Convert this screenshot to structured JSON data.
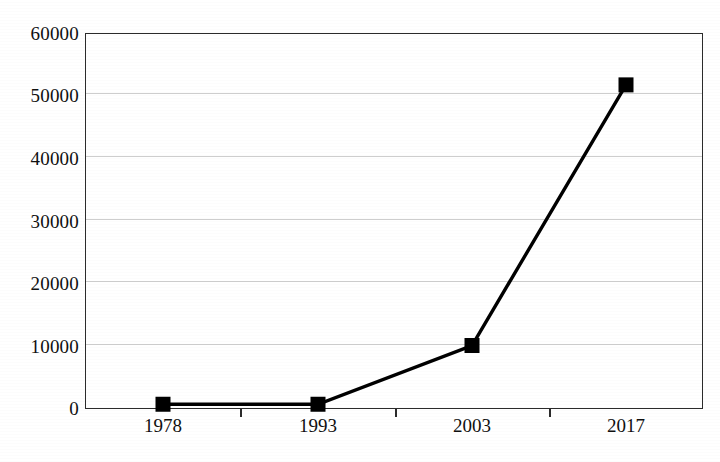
{
  "chart_data": {
    "type": "line",
    "title": "",
    "subtitle": "",
    "xlabel": "",
    "ylabel": "",
    "categories": [
      "1978",
      "1993",
      "2003",
      "2017"
    ],
    "values": [
      600,
      600,
      10000,
      51700
    ],
    "series": [
      {
        "name": "",
        "values": [
          600,
          600,
          10000,
          51700
        ]
      }
    ],
    "ylim": [
      0,
      60000
    ],
    "y_ticks": [
      0,
      10000,
      20000,
      30000,
      40000,
      50000,
      60000
    ],
    "y_tick_labels": [
      "0",
      "10000",
      "20000",
      "30000",
      "40000",
      "50000",
      "60000"
    ],
    "x_tick_labels": [
      "1978",
      "1993",
      "2003",
      "2017"
    ],
    "grid": "horizontal",
    "legend": "none",
    "marker": "filled-square",
    "marker_color": "#000000",
    "line_color": "#000000",
    "gridline_color": "#c9c9c9",
    "axis_color": "#2b2b2b",
    "background": "#ffffff",
    "annotations": []
  },
  "axes": {
    "y": {
      "labels": [
        "60000",
        "50000",
        "40000",
        "30000",
        "20000",
        "10000",
        "0"
      ],
      "positions_px": [
        33,
        95,
        158,
        221,
        283,
        346,
        408
      ]
    },
    "x": {
      "labels": [
        "1978",
        "1993",
        "2003",
        "2017"
      ],
      "positions_px": [
        163,
        318,
        472,
        626
      ]
    }
  },
  "caption": {
    "text": "",
    "note": "clipped-at-image-bottom-edge"
  }
}
